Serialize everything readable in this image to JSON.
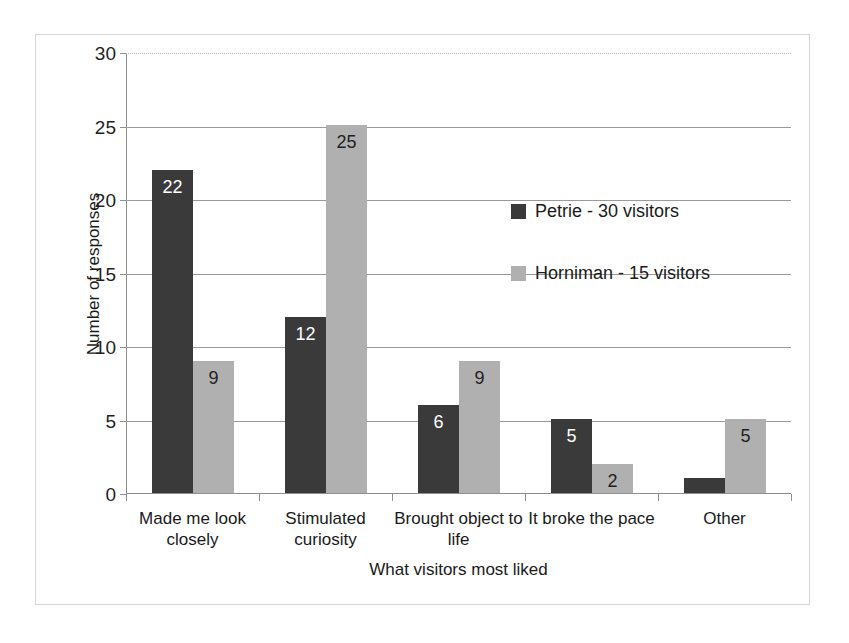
{
  "chart_data": {
    "type": "bar",
    "title": "",
    "xlabel": "What visitors most liked",
    "ylabel": "Number of responses",
    "ylim": [
      0,
      30
    ],
    "yticks": [
      0,
      5,
      10,
      15,
      20,
      25,
      30
    ],
    "grid": true,
    "legend_position": "inside-upper-right",
    "categories": [
      "Made me look closely",
      "Stimulated curiosity",
      "Brought object to life",
      "It broke the pace",
      "Other"
    ],
    "category_lines": [
      [
        "Made me look",
        "closely"
      ],
      [
        "Stimulated",
        "curiosity"
      ],
      [
        "Brought object to",
        "life"
      ],
      [
        "It broke the pace",
        ""
      ],
      [
        "Other",
        ""
      ]
    ],
    "series": [
      {
        "name": "Petrie - 30 visitors",
        "color": "#3a3a3a",
        "values": [
          22,
          12,
          6,
          5,
          1
        ],
        "labels": [
          "22",
          "12",
          "6",
          "5",
          ""
        ]
      },
      {
        "name": "Horniman - 15 visitors",
        "color": "#b0b0b0",
        "values": [
          9,
          25,
          9,
          2,
          5
        ],
        "labels": [
          "9",
          "25",
          "9",
          "2",
          "5"
        ]
      }
    ]
  },
  "colors": {
    "series_dark": "#3a3a3a",
    "series_light": "#b0b0b0",
    "grid": "#9a9a9a",
    "axis": "#8f8f8f",
    "border": "#d6d6d6",
    "text": "#1a1a1a"
  }
}
